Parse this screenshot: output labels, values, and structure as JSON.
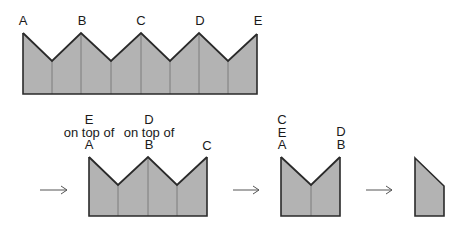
{
  "colors": {
    "fill": "#b3b3b3",
    "stroke": "#2a2a2a",
    "fold": "#7d7d7d",
    "arrow": "#555555"
  },
  "stage1": {
    "labels": {
      "a": "A",
      "b": "B",
      "c": "C",
      "d": "D",
      "e": "E"
    }
  },
  "stage2": {
    "labels": {
      "a_stack": [
        "E",
        "on top of",
        "A"
      ],
      "b_stack": [
        "D",
        "on top of",
        "B"
      ],
      "c": "C"
    }
  },
  "stage3": {
    "labels": {
      "left_stack": [
        "C",
        "E",
        "A"
      ],
      "right_stack": [
        "D",
        "B"
      ]
    }
  },
  "arrows": [
    "arrow-1",
    "arrow-2",
    "arrow-3"
  ]
}
